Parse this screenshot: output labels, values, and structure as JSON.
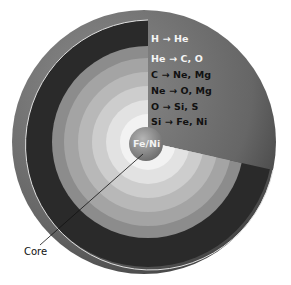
{
  "layers": [
    {
      "label": "H → He",
      "color": "#2e2e2e",
      "text_color": "#f5f5f5"
    },
    {
      "label": "He → C, O",
      "color": "#8a8a8a",
      "text_color": "#f5f5f5"
    },
    {
      "label": "C → Ne, Mg",
      "color": "#a6a6a6",
      "text_color": "#111111"
    },
    {
      "label": "Ne → O, Mg",
      "color": "#bcbcbc",
      "text_color": "#111111"
    },
    {
      "label": "O → Si, S",
      "color": "#d2d2d2",
      "text_color": "#111111"
    },
    {
      "label": "Si → Fe, Ni",
      "color": "#e6e6e6",
      "text_color": "#111111"
    }
  ],
  "core": {
    "label": "Fe/Ni",
    "color": "#8c8c8c"
  },
  "pointer": {
    "label": "Core"
  },
  "colors": {
    "surface": "#6e6e6e",
    "cut_edge": "#e0e0e0",
    "background": "#ffffff"
  }
}
